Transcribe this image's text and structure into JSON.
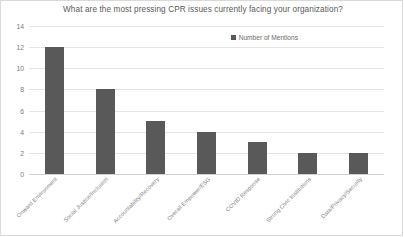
{
  "chart_data": {
    "type": "bar",
    "title": "What are the most pressing CPR issues currently facing your organization?",
    "xlabel": "",
    "ylabel": "",
    "ylim": [
      0,
      14
    ],
    "ytick_step": 2,
    "yticks": [
      "0",
      "2",
      "4",
      "6",
      "8",
      "10",
      "12",
      "14"
    ],
    "grid": true,
    "legend_position": "top-right",
    "categories": [
      "Onward Environment",
      "Social Justice/Inclusion",
      "Accountability/Recovery",
      "Overall Empower/ESG",
      "COVID Response",
      "Strong Civic Institutions",
      "Data/Privacy/Security"
    ],
    "series": [
      {
        "name": "Number of Mentions",
        "values": [
          12,
          8,
          5,
          4,
          3,
          2,
          2
        ],
        "color": "#595959"
      }
    ]
  },
  "legend": {
    "label": "Number of Mentions"
  },
  "colors": {
    "bar": "#595959",
    "gridline": "#e4e4e4",
    "text": "#595959",
    "tick_text": "#7a7a7a",
    "frame": "#d9d9d9"
  }
}
